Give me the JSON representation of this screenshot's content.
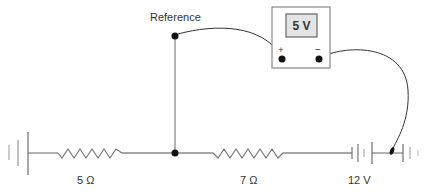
{
  "diagram": {
    "reference_label": "Reference",
    "voltmeter": {
      "reading": "5 V",
      "positive_terminal": "+",
      "negative_terminal": "−"
    },
    "resistors": [
      {
        "label": "5 Ω",
        "value_ohms": 5
      },
      {
        "label": "7 Ω",
        "value_ohms": 7
      }
    ],
    "battery": {
      "label": "12 V",
      "value_volts": 12
    },
    "colors": {
      "wire": "#888888",
      "ink": "#222222",
      "display_fill": "#e4e4e4",
      "label": "#333333"
    }
  }
}
